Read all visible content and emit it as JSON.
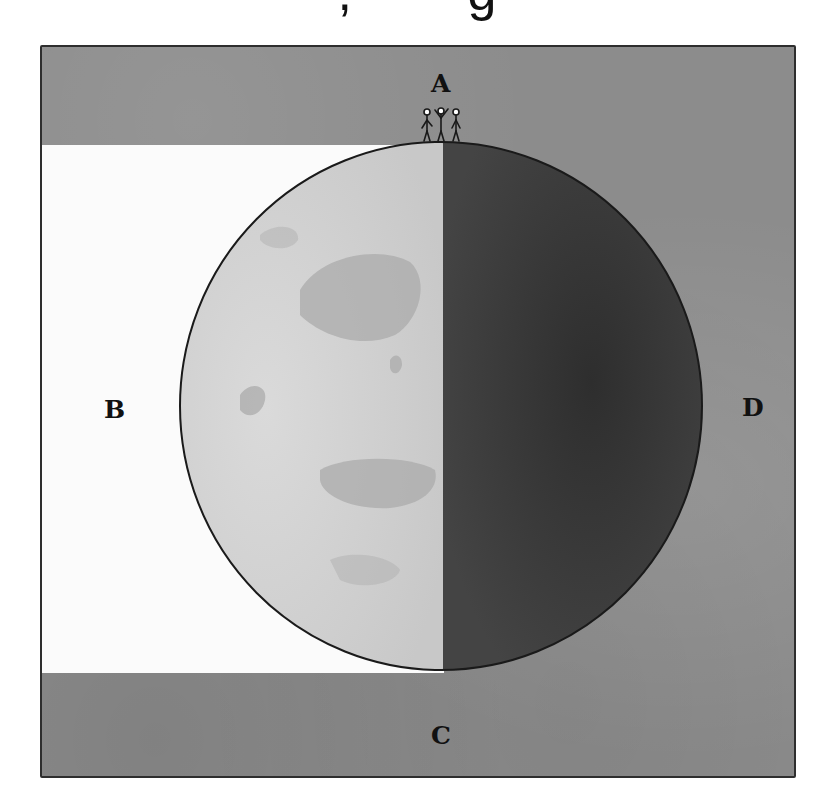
{
  "caption_fragment": ",        g",
  "diagram": {
    "labels": {
      "A": "A",
      "B": "B",
      "C": "C",
      "D": "D"
    },
    "colors": {
      "background_shadow": "#8c8c8c",
      "sunlit_region": "#fbfbfb",
      "globe_lit": "#d2d2d2",
      "globe_continents": "#aaaaaa",
      "globe_dark": "#3c3c3c",
      "outline": "#1a1a1a"
    },
    "observers": {
      "count": 3,
      "position": "A"
    }
  }
}
